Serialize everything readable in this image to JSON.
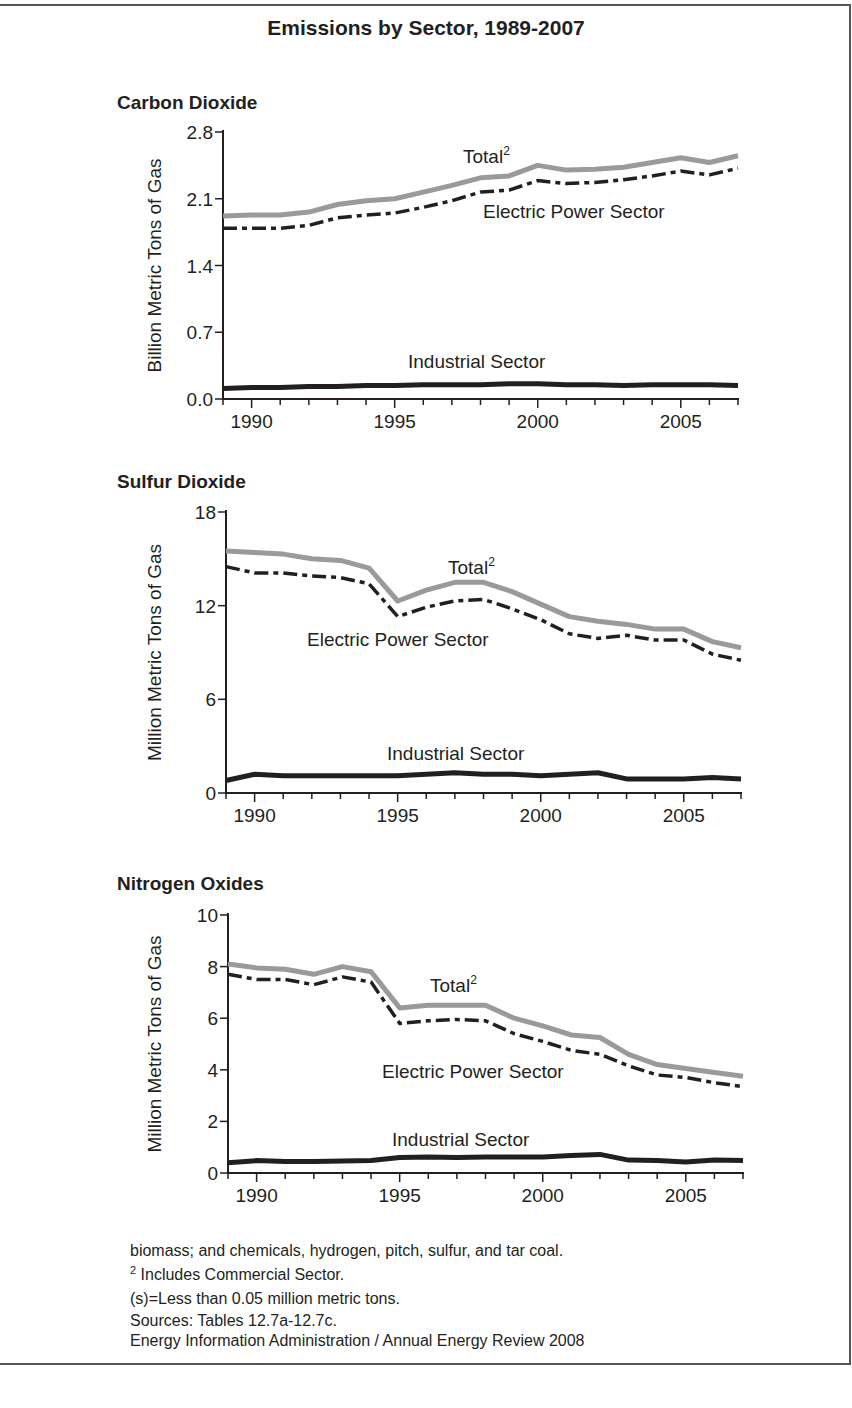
{
  "title": "Emissions by Sector, 1989-2007",
  "panels": [
    {
      "title": "Carbon Dioxide",
      "ylabel": "Billion Metric Tons of Gas"
    },
    {
      "title": "Sulfur Dioxide",
      "ylabel": "Million Metric Tons of Gas"
    },
    {
      "title": "Nitrogen Oxides",
      "ylabel": "Million Metric Tons of Gas"
    }
  ],
  "footnotes": {
    "line1": "biomass; and chemicals, hydrogen, pitch, sulfur, and tar coal.",
    "line2_sup": "2",
    "line2": " Includes Commercial Sector.",
    "line3": "(s)=Less than 0.05 million metric tons.",
    "line4": "Sources: Tables 12.7a-12.7c.",
    "line5": "Energy Information Administration / Annual Energy Review 2008"
  },
  "colors": {
    "total": "#9a9a9a",
    "electric": "#231f20",
    "industrial": "#231f20",
    "axis": "#231f20"
  },
  "chart_data": [
    {
      "type": "line",
      "title": "Carbon Dioxide",
      "xlabel": "",
      "ylabel": "Billion Metric Tons of Gas",
      "x": [
        1989,
        1990,
        1991,
        1992,
        1993,
        1994,
        1995,
        1996,
        1997,
        1998,
        1999,
        2000,
        2001,
        2002,
        2003,
        2004,
        2005,
        2006,
        2007
      ],
      "xticks": [
        1990,
        1995,
        2000,
        2005
      ],
      "yticks": [
        0.0,
        0.7,
        1.4,
        2.1,
        2.8
      ],
      "ytick_labels": [
        "0.0",
        "0.7",
        "1.4",
        "2.1",
        "2.8"
      ],
      "ylim": [
        0,
        2.8
      ],
      "grid": false,
      "series": [
        {
          "name": "Total",
          "label": "Total",
          "label_sup": "2",
          "style": "solid-gray",
          "values": [
            1.92,
            1.93,
            1.93,
            1.96,
            2.04,
            2.08,
            2.1,
            2.17,
            2.24,
            2.32,
            2.34,
            2.45,
            2.4,
            2.41,
            2.43,
            2.48,
            2.53,
            2.48,
            2.55
          ]
        },
        {
          "name": "Electric Power Sector",
          "label": "Electric Power Sector",
          "style": "dash-dot",
          "values": [
            1.79,
            1.79,
            1.79,
            1.82,
            1.9,
            1.93,
            1.95,
            2.01,
            2.08,
            2.17,
            2.19,
            2.29,
            2.26,
            2.27,
            2.3,
            2.34,
            2.39,
            2.35,
            2.42
          ]
        },
        {
          "name": "Industrial Sector",
          "label": "Industrial Sector",
          "style": "solid-black",
          "values": [
            0.11,
            0.12,
            0.12,
            0.13,
            0.13,
            0.14,
            0.14,
            0.15,
            0.15,
            0.15,
            0.16,
            0.16,
            0.15,
            0.15,
            0.14,
            0.15,
            0.15,
            0.15,
            0.14
          ]
        }
      ],
      "annotations": [
        "Total2",
        "Electric Power Sector",
        "Industrial Sector"
      ]
    },
    {
      "type": "line",
      "title": "Sulfur Dioxide",
      "xlabel": "",
      "ylabel": "Million Metric Tons of Gas",
      "x": [
        1989,
        1990,
        1991,
        1992,
        1993,
        1994,
        1995,
        1996,
        1997,
        1998,
        1999,
        2000,
        2001,
        2002,
        2003,
        2004,
        2005,
        2006,
        2007
      ],
      "xticks": [
        1990,
        1995,
        2000,
        2005
      ],
      "yticks": [
        0,
        6,
        12,
        18
      ],
      "ytick_labels": [
        "0",
        "6",
        "12",
        "18"
      ],
      "ylim": [
        0,
        18
      ],
      "grid": false,
      "series": [
        {
          "name": "Total",
          "label": "Total",
          "label_sup": "2",
          "style": "solid-gray",
          "values": [
            15.5,
            15.4,
            15.3,
            15.0,
            14.9,
            14.4,
            12.3,
            13.0,
            13.5,
            13.5,
            12.9,
            12.1,
            11.3,
            11.0,
            10.8,
            10.5,
            10.5,
            9.7,
            9.3
          ]
        },
        {
          "name": "Electric Power Sector",
          "label": "Electric Power Sector",
          "style": "dash-dot",
          "values": [
            14.5,
            14.1,
            14.1,
            13.9,
            13.8,
            13.4,
            11.3,
            11.9,
            12.3,
            12.4,
            11.8,
            11.1,
            10.2,
            9.9,
            10.1,
            9.8,
            9.8,
            8.9,
            8.5
          ]
        },
        {
          "name": "Industrial Sector",
          "label": "Industrial Sector",
          "style": "solid-black",
          "values": [
            0.8,
            1.2,
            1.1,
            1.1,
            1.1,
            1.1,
            1.1,
            1.2,
            1.3,
            1.2,
            1.2,
            1.1,
            1.2,
            1.3,
            0.9,
            0.9,
            0.9,
            1.0,
            0.9
          ]
        }
      ],
      "annotations": [
        "Total2",
        "Electric Power Sector",
        "Industrial Sector"
      ]
    },
    {
      "type": "line",
      "title": "Nitrogen Oxides",
      "xlabel": "",
      "ylabel": "Million Metric Tons of Gas",
      "x": [
        1989,
        1990,
        1991,
        1992,
        1993,
        1994,
        1995,
        1996,
        1997,
        1998,
        1999,
        2000,
        2001,
        2002,
        2003,
        2004,
        2005,
        2006,
        2007
      ],
      "xticks": [
        1990,
        1995,
        2000,
        2005
      ],
      "yticks": [
        0,
        2,
        4,
        6,
        8,
        10
      ],
      "ytick_labels": [
        "0",
        "2",
        "4",
        "6",
        "8",
        "10"
      ],
      "ylim": [
        0,
        10
      ],
      "grid": false,
      "series": [
        {
          "name": "Total",
          "label": "Total",
          "label_sup": "2",
          "style": "solid-gray",
          "values": [
            8.1,
            7.95,
            7.9,
            7.7,
            8.0,
            7.8,
            6.4,
            6.5,
            6.5,
            6.5,
            6.0,
            5.7,
            5.35,
            5.25,
            4.6,
            4.2,
            4.05,
            3.9,
            3.75
          ]
        },
        {
          "name": "Electric Power Sector",
          "label": "Electric Power Sector",
          "style": "dash-dot",
          "values": [
            7.7,
            7.5,
            7.5,
            7.3,
            7.6,
            7.4,
            5.8,
            5.9,
            5.95,
            5.9,
            5.4,
            5.1,
            4.75,
            4.6,
            4.15,
            3.8,
            3.7,
            3.5,
            3.35
          ]
        },
        {
          "name": "Industrial Sector",
          "label": "Industrial Sector",
          "style": "solid-black",
          "values": [
            0.4,
            0.48,
            0.45,
            0.45,
            0.46,
            0.48,
            0.6,
            0.62,
            0.6,
            0.62,
            0.62,
            0.62,
            0.68,
            0.72,
            0.5,
            0.48,
            0.43,
            0.5,
            0.48
          ]
        }
      ],
      "annotations": [
        "Total2",
        "Electric Power Sector",
        "Industrial Sector"
      ]
    }
  ]
}
